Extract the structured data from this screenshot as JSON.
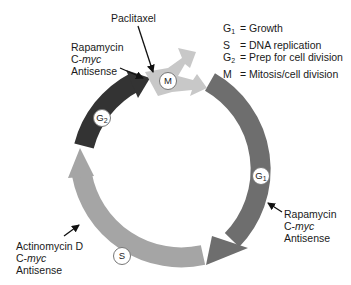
{
  "diagram": {
    "phases": [
      {
        "id": "M",
        "label": "M",
        "sub": "",
        "color": "#c8c8c8"
      },
      {
        "id": "G1",
        "label": "G",
        "sub": "1",
        "color": "#6e6e6e"
      },
      {
        "id": "S",
        "label": "S",
        "sub": "",
        "color": "#a5a5a5"
      },
      {
        "id": "G2",
        "label": "G",
        "sub": "2",
        "color": "#333333"
      }
    ],
    "legend": [
      {
        "key": "G",
        "sub": "1",
        "text": "= Growth"
      },
      {
        "key": "S",
        "sub": "",
        "text": "= DNA replication"
      },
      {
        "key": "G",
        "sub": "2",
        "text": "= Prep for cell division"
      },
      {
        "key": "M",
        "sub": "",
        "text": "= Mitosis/cell division"
      }
    ],
    "annotations": {
      "paclitaxel": {
        "line1": "Paclitaxel"
      },
      "rapamycin_top": {
        "line1": "Rapamycin",
        "line2_prefix": "C-",
        "line2_italic": "myc",
        "line3": "Antisense"
      },
      "rapamycin_right": {
        "line1": "Rapamycin",
        "line2_prefix": "C-",
        "line2_italic": "myc",
        "line3": "Antisense"
      },
      "actinomycin": {
        "line1": "Actinomycin D",
        "line2_prefix": "C-",
        "line2_italic": "myc",
        "line3": "Antisense"
      }
    }
  }
}
